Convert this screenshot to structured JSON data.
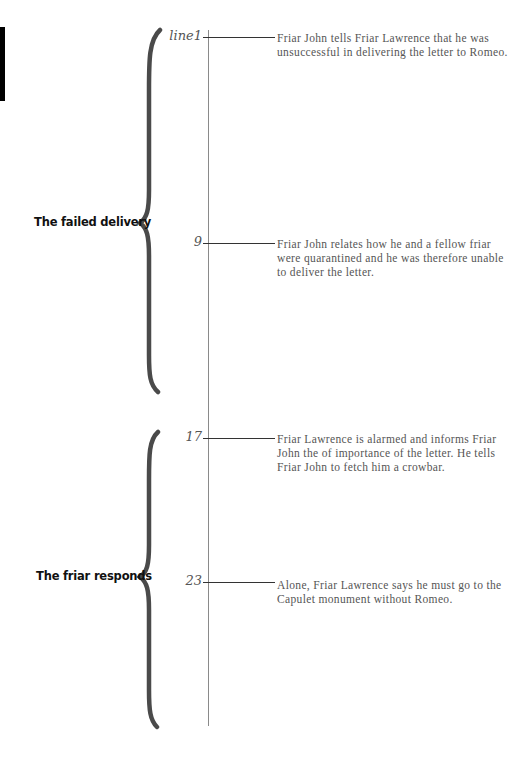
{
  "diagram": {
    "type": "timeline",
    "colors": {
      "brace": "#4a4a4a",
      "timeline": "#8a8a8a",
      "connector": "#333333",
      "text": "#555555",
      "section_label": "#111111"
    },
    "sections": [
      {
        "label": "The failed delivery"
      },
      {
        "label": "The friar responds"
      }
    ],
    "events": [
      {
        "line": "line1",
        "text": "Friar John tells Friar Lawrence that he was unsuccessful in delivering the letter to Romeo."
      },
      {
        "line": "9",
        "text": "Friar John relates how he and a fellow friar were quarantined and he was therefore unable to deliver the letter."
      },
      {
        "line": "17",
        "text": "Friar Lawrence is alarmed and informs Friar John the of importance of the letter. He tells Friar John to fetch him a crowbar."
      },
      {
        "line": "23",
        "text": "Alone, Friar Lawrence says he must go to the Capulet monument without Romeo."
      }
    ]
  }
}
